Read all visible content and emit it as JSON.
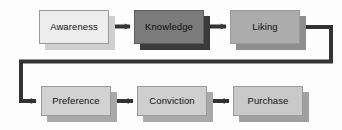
{
  "diagram": {
    "background": "#fdfdfd",
    "line_color": "#333333",
    "nodes": [
      {
        "id": "awareness",
        "label": "Awareness",
        "x": 39,
        "y": 10,
        "w": 70,
        "h": 34,
        "fill": "#ededed",
        "shadow": "#cfcfcf",
        "shadow_dx": 6,
        "shadow_dy": 6,
        "tone": "light"
      },
      {
        "id": "knowledge",
        "label": "Knowledge",
        "x": 134,
        "y": 10,
        "w": 70,
        "h": 34,
        "fill": "#7b7b7b",
        "shadow": "#3a3a3a",
        "shadow_dx": 6,
        "shadow_dy": 6,
        "tone": "dark"
      },
      {
        "id": "liking",
        "label": "Liking",
        "x": 230,
        "y": 10,
        "w": 70,
        "h": 34,
        "fill": "#acacac",
        "shadow": "#8e8e8e",
        "shadow_dx": 6,
        "shadow_dy": 6,
        "tone": "mid"
      },
      {
        "id": "preference",
        "label": "Preference",
        "x": 41,
        "y": 86,
        "w": 70,
        "h": 30,
        "fill": "#d2d2d2",
        "shadow": "#a9a9a9",
        "shadow_dx": 6,
        "shadow_dy": 6,
        "tone": "light"
      },
      {
        "id": "conviction",
        "label": "Conviction",
        "x": 137,
        "y": 86,
        "w": 70,
        "h": 30,
        "fill": "#cfcfcf",
        "shadow": "#a9a9a9",
        "shadow_dx": 6,
        "shadow_dy": 6,
        "tone": "light"
      },
      {
        "id": "purchase",
        "label": "Purchase",
        "x": 233,
        "y": 86,
        "w": 70,
        "h": 30,
        "fill": "#c9c9c9",
        "shadow": "#a0a0a0",
        "shadow_dx": 6,
        "shadow_dy": 6,
        "tone": "light"
      }
    ],
    "connectors": [
      {
        "id": "awareness-to-knowledge",
        "from": "awareness",
        "to": "knowledge",
        "kind": "arrow-right"
      },
      {
        "id": "knowledge-to-liking",
        "from": "knowledge",
        "to": "liking",
        "kind": "arrow-right"
      },
      {
        "id": "liking-to-preference",
        "from": "liking",
        "to": "preference",
        "kind": "wrap-around"
      },
      {
        "id": "preference-to-conviction",
        "from": "preference",
        "to": "conviction",
        "kind": "arrow-right"
      },
      {
        "id": "conviction-to-purchase",
        "from": "conviction",
        "to": "purchase",
        "kind": "arrow-right"
      }
    ]
  }
}
